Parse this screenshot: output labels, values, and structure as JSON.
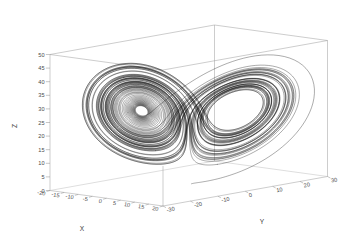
{
  "figure": {
    "kind": "gnuplot-3d-lineplot",
    "background_color": "#ffffff",
    "curve_color": "#000000",
    "frame_color": "#9a9a9a",
    "text_color": "#4a4a4a"
  },
  "axes": {
    "x": {
      "label": "X",
      "ticks": [
        "-20",
        "-15",
        "-10",
        "-5",
        "0",
        "5",
        "10",
        "15",
        "20"
      ],
      "tick_values": [
        -20,
        -15,
        -10,
        -5,
        0,
        5,
        10,
        15,
        20
      ],
      "range": [
        -20,
        20
      ]
    },
    "y": {
      "label": "Y",
      "ticks": [
        "-30",
        "-20",
        "-10",
        "0",
        "10",
        "20",
        "30"
      ],
      "tick_values": [
        -30,
        -20,
        -10,
        0,
        10,
        20,
        30
      ],
      "range": [
        -30,
        30
      ]
    },
    "z": {
      "label": "Z",
      "ticks": [
        "0",
        "5",
        "10",
        "15",
        "20",
        "25",
        "30",
        "35",
        "40",
        "45",
        "50"
      ],
      "tick_values": [
        0,
        5,
        10,
        15,
        20,
        25,
        30,
        35,
        40,
        45,
        50
      ],
      "range": [
        0,
        50
      ]
    }
  },
  "chart_data": {
    "type": "line",
    "title": "",
    "xlabel": "X",
    "ylabel": "Y",
    "zlabel": "Z",
    "xlim": [
      -20,
      20
    ],
    "ylim": [
      -30,
      30
    ],
    "zlim": [
      0,
      50
    ],
    "grid": false,
    "legend": "none",
    "projection": "3d",
    "view": {
      "rot_x": 60,
      "rot_z": 30,
      "scale": 1.0
    },
    "system": {
      "name": "Lorenz attractor",
      "equations": [
        "dx/dt = sigma*(y-x)",
        "dy/dt = x*(rho-z)-y",
        "dz/dt = x*y-beta*z"
      ],
      "sigma": 10,
      "rho": 28,
      "beta": 2.6666666667,
      "initial_state": [
        0.9,
        0.0,
        0.0
      ],
      "dt": 0.0045,
      "steps": 18000
    },
    "series": [
      {
        "name": "trajectory",
        "color": "#000000",
        "linewidth": 0.33
      }
    ]
  }
}
